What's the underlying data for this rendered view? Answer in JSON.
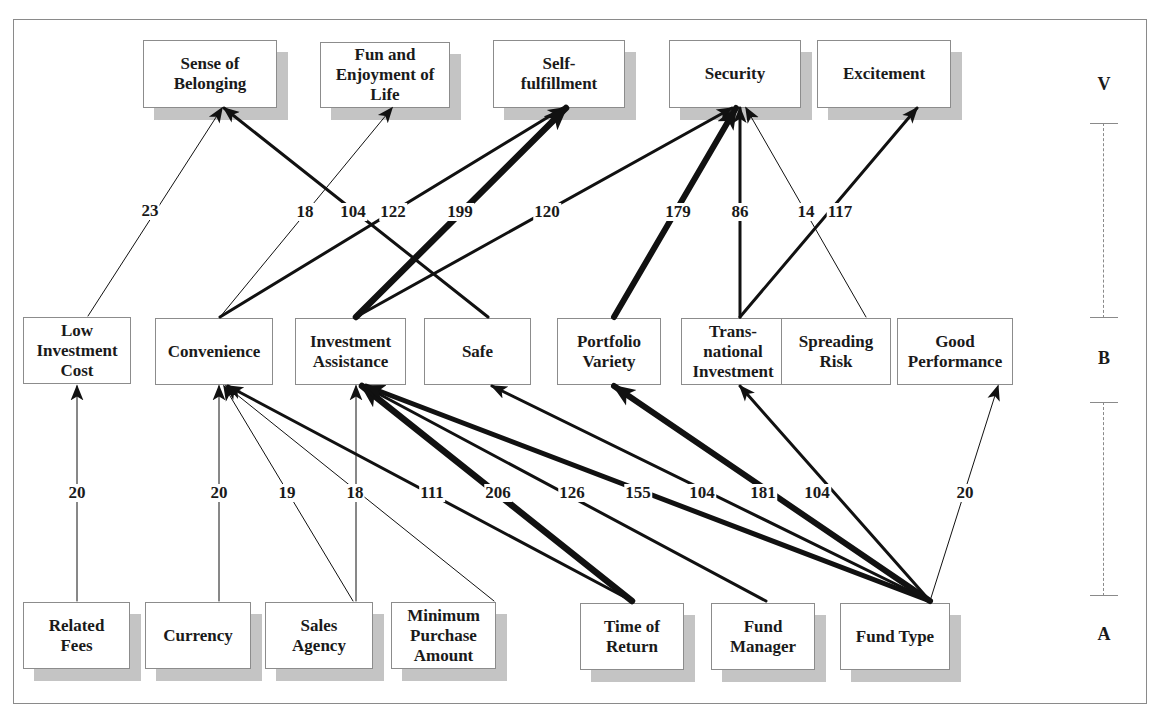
{
  "diagram": {
    "type": "hierarchical value map",
    "levels": [
      {
        "id": "V",
        "label": "V",
        "name": "values",
        "y": 84
      },
      {
        "id": "B",
        "label": "B",
        "name": "benefits",
        "y": 358
      },
      {
        "id": "A",
        "label": "A",
        "name": "attributes",
        "y": 634
      }
    ],
    "nodes": {
      "values": [
        {
          "id": "sense_of_belonging",
          "label": "Sense of\nBelonging",
          "x": 143,
          "y": 40,
          "w": 134,
          "h": 68
        },
        {
          "id": "fun_enjoyment",
          "label": "Fun and\nEnjoyment of\nLife",
          "x": 320,
          "y": 42,
          "w": 130,
          "h": 66
        },
        {
          "id": "self_fulfillment",
          "label": "Self-\nfulfillment",
          "x": 493,
          "y": 40,
          "w": 132,
          "h": 68
        },
        {
          "id": "security",
          "label": "Security",
          "x": 669,
          "y": 40,
          "w": 132,
          "h": 68
        },
        {
          "id": "excitement",
          "label": "Excitement",
          "x": 817,
          "y": 40,
          "w": 134,
          "h": 68
        }
      ],
      "benefits": [
        {
          "id": "low_investment_cost",
          "label": "Low\nInvestment\nCost",
          "x": 23,
          "y": 317,
          "w": 108,
          "h": 67
        },
        {
          "id": "convenience",
          "label": "Convenience",
          "x": 155,
          "y": 318,
          "w": 118,
          "h": 67
        },
        {
          "id": "investment_assistance",
          "label": "Investment\nAssistance",
          "x": 295,
          "y": 318,
          "w": 111,
          "h": 67
        },
        {
          "id": "safe",
          "label": "Safe",
          "x": 424,
          "y": 318,
          "w": 107,
          "h": 67
        },
        {
          "id": "portfolio_variety",
          "label": "Portfolio\nVariety",
          "x": 557,
          "y": 318,
          "w": 104,
          "h": 67
        },
        {
          "id": "transnational_investment",
          "label": "Trans-\nnational\nInvestment",
          "x": 681,
          "y": 318,
          "w": 104,
          "h": 67
        },
        {
          "id": "spreading_risk",
          "label": "Spreading\nRisk",
          "x": 781,
          "y": 318,
          "w": 110,
          "h": 67
        },
        {
          "id": "good_performance",
          "label": "Good\nPerformance",
          "x": 897,
          "y": 318,
          "w": 116,
          "h": 67
        }
      ],
      "attributes": [
        {
          "id": "related_fees",
          "label": "Related\nFees",
          "x": 23,
          "y": 602,
          "w": 107,
          "h": 67
        },
        {
          "id": "currency",
          "label": "Currency",
          "x": 145,
          "y": 602,
          "w": 106,
          "h": 67
        },
        {
          "id": "sales_agency",
          "label": "Sales\nAgency",
          "x": 265,
          "y": 602,
          "w": 108,
          "h": 67
        },
        {
          "id": "minimum_purchase_amount",
          "label": "Minimum\nPurchase\nAmount",
          "x": 391,
          "y": 602,
          "w": 105,
          "h": 67
        },
        {
          "id": "time_of_return",
          "label": "Time of\nReturn",
          "x": 580,
          "y": 603,
          "w": 104,
          "h": 67
        },
        {
          "id": "fund_manager",
          "label": "Fund\nManager",
          "x": 711,
          "y": 603,
          "w": 104,
          "h": 67
        },
        {
          "id": "fund_type",
          "label": "Fund Type",
          "x": 840,
          "y": 603,
          "w": 110,
          "h": 67
        }
      ]
    },
    "links": [
      {
        "from": "low_investment_cost",
        "to": "sense_of_belonging",
        "value": "23",
        "x1": 88,
        "y1": 316,
        "x2": 222,
        "y2": 108,
        "width": 1,
        "lx": 150,
        "ly": 211
      },
      {
        "from": "safe",
        "to": "sense_of_belonging",
        "value": "104",
        "x1": 488,
        "y1": 317,
        "x2": 224,
        "y2": 108,
        "width": 3,
        "lx": 353,
        "ly": 212
      },
      {
        "from": "convenience",
        "to": "fun_enjoyment",
        "value": "18",
        "x1": 220,
        "y1": 317,
        "x2": 392,
        "y2": 108,
        "width": 1,
        "lx": 305,
        "ly": 212
      },
      {
        "from": "convenience",
        "to": "self_fulfillment",
        "value": "122",
        "x1": 220,
        "y1": 317,
        "x2": 563,
        "y2": 108,
        "width": 3,
        "lx": 393,
        "ly": 212
      },
      {
        "from": "investment_assistance",
        "to": "self_fulfillment",
        "value": "199",
        "x1": 356,
        "y1": 317,
        "x2": 566,
        "y2": 108,
        "width": 6.5,
        "lx": 460,
        "ly": 212
      },
      {
        "from": "investment_assistance",
        "to": "security",
        "value": "120",
        "x1": 356,
        "y1": 317,
        "x2": 732,
        "y2": 108,
        "width": 3,
        "lx": 547,
        "ly": 212
      },
      {
        "from": "portfolio_variety",
        "to": "security",
        "value": "179",
        "x1": 614,
        "y1": 317,
        "x2": 736,
        "y2": 108,
        "width": 6,
        "lx": 678,
        "ly": 212
      },
      {
        "from": "transnational_investment",
        "to": "security",
        "value": "86",
        "x1": 740,
        "y1": 317,
        "x2": 740,
        "y2": 108,
        "width": 3,
        "lx": 740,
        "ly": 212
      },
      {
        "from": "spreading_risk",
        "to": "security",
        "value": "14",
        "x1": 866,
        "y1": 317,
        "x2": 746,
        "y2": 108,
        "width": 1,
        "lx": 806,
        "ly": 212
      },
      {
        "from": "transnational_investment",
        "to": "excitement",
        "value": "117",
        "x1": 740,
        "y1": 317,
        "x2": 917,
        "y2": 108,
        "width": 3,
        "lx": 840,
        "ly": 212
      },
      {
        "from": "related_fees",
        "to": "low_investment_cost",
        "value": "20",
        "x1": 77,
        "y1": 601,
        "x2": 77,
        "y2": 386,
        "width": 1,
        "lx": 77,
        "ly": 493
      },
      {
        "from": "currency",
        "to": "convenience",
        "value": "20",
        "x1": 219,
        "y1": 601,
        "x2": 219,
        "y2": 386,
        "width": 1,
        "lx": 219,
        "ly": 493
      },
      {
        "from": "sales_agency",
        "to": "convenience",
        "value": "19",
        "x1": 353,
        "y1": 601,
        "x2": 224,
        "y2": 386,
        "width": 1,
        "lx": 287,
        "ly": 493
      },
      {
        "from": "minimum_purchase_amount",
        "to": "convenience",
        "value": "18",
        "x1": 494,
        "y1": 601,
        "x2": 226,
        "y2": 386,
        "width": 1,
        "lx": 355,
        "ly": 493
      },
      {
        "from": "sales_agency",
        "to": "investment_assistance",
        "value": "",
        "x1": 356,
        "y1": 601,
        "x2": 356,
        "y2": 386,
        "width": 1,
        "lx": 0,
        "ly": 0
      },
      {
        "from": "time_of_return",
        "to": "convenience",
        "value": "111",
        "x1": 632,
        "y1": 601,
        "x2": 228,
        "y2": 386,
        "width": 3,
        "lx": 432,
        "ly": 493
      },
      {
        "from": "time_of_return",
        "to": "investment_assistance",
        "value": "206",
        "x1": 632,
        "y1": 601,
        "x2": 362,
        "y2": 386,
        "width": 6.5,
        "lx": 498,
        "ly": 493
      },
      {
        "from": "fund_manager",
        "to": "investment_assistance",
        "value": "126",
        "x1": 766,
        "y1": 601,
        "x2": 364,
        "y2": 386,
        "width": 3,
        "lx": 572,
        "ly": 493
      },
      {
        "from": "fund_type",
        "to": "investment_assistance",
        "value": "155",
        "x1": 930,
        "y1": 601,
        "x2": 366,
        "y2": 386,
        "width": 5,
        "lx": 638,
        "ly": 493
      },
      {
        "from": "fund_type",
        "to": "safe",
        "value": "104",
        "x1": 930,
        "y1": 601,
        "x2": 492,
        "y2": 386,
        "width": 3,
        "lx": 702,
        "ly": 493
      },
      {
        "from": "fund_type",
        "to": "portfolio_variety",
        "value": "181",
        "x1": 930,
        "y1": 601,
        "x2": 614,
        "y2": 386,
        "width": 6,
        "lx": 763,
        "ly": 493
      },
      {
        "from": "fund_type",
        "to": "transnational_investment",
        "value": "104",
        "x1": 930,
        "y1": 601,
        "x2": 740,
        "y2": 386,
        "width": 3,
        "lx": 817,
        "ly": 493
      },
      {
        "from": "fund_type",
        "to": "good_performance",
        "value": "20",
        "x1": 930,
        "y1": 601,
        "x2": 998,
        "y2": 386,
        "width": 1,
        "lx": 965,
        "ly": 493
      }
    ],
    "scale_bars": [
      {
        "id": "v_to_b",
        "top": 123,
        "bottom": 318
      },
      {
        "id": "b_to_a",
        "top": 402,
        "bottom": 596
      }
    ],
    "colors": {
      "line": "#111111",
      "box_border": "#8c8c8c",
      "shadow": "#c4c4c4",
      "frame": "#8a8a8a"
    }
  }
}
